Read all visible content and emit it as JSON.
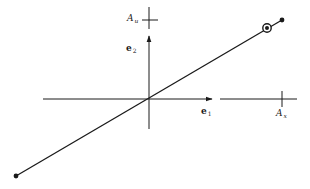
{
  "diagram": {
    "type": "vector-space-axes",
    "colors": {
      "stroke": "#1a1a1a",
      "background": "#ffffff"
    },
    "origin": {
      "x": 149,
      "y": 99
    },
    "axes": {
      "horizontal": {
        "from": [
          43,
          99
        ],
        "arrow_tip": [
          212,
          99
        ],
        "continue_from": [
          220,
          99
        ],
        "to": [
          297,
          99
        ]
      },
      "vertical": {
        "from": [
          149,
          129
        ],
        "arrow_tip": [
          149,
          36
        ]
      }
    },
    "basis_vectors": [
      {
        "name": "e1",
        "label": "e",
        "subscript": "1"
      },
      {
        "name": "e2",
        "label": "e",
        "subscript": "2"
      }
    ],
    "ticks": [
      {
        "name": "A_x",
        "label": "A",
        "subscript": "x",
        "axis": "horizontal",
        "x": 282,
        "y": 99
      },
      {
        "name": "A_u",
        "label": "A",
        "subscript": "u",
        "axis": "vertical",
        "x": 149,
        "y": 20
      }
    ],
    "line": {
      "from": [
        16,
        176
      ],
      "to": [
        282,
        20
      ]
    },
    "endpoints": [
      {
        "name": "lower-left-point",
        "x": 16,
        "y": 176
      },
      {
        "name": "upper-right-point",
        "x": 282,
        "y": 20
      }
    ],
    "marked_point": {
      "name": "circled-point",
      "x": 267,
      "y": 28,
      "r": 4
    }
  }
}
